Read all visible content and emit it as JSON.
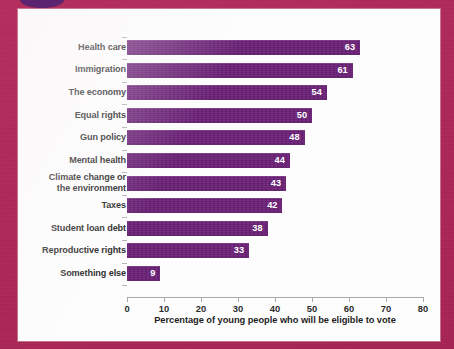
{
  "colors": {
    "background": "#b32a5c",
    "card": "#fdfdfd",
    "bar": "#6b2177",
    "value_text": "#ffffff",
    "axis": "#a9a9a9",
    "label_text": "#2c2c2c",
    "accent_ellipse": "#5c2470"
  },
  "decorations": {
    "top_ellipse_name": "purple-ellipse-decoration"
  },
  "chart_data": {
    "type": "bar",
    "orientation": "horizontal",
    "title": "",
    "xlabel": "Percentage of young people who will be eligible to vote",
    "ylabel": "",
    "xlim": [
      0,
      80
    ],
    "xticks": [
      0,
      10,
      20,
      30,
      40,
      50,
      60,
      70,
      80
    ],
    "xtick_labels": [
      "0",
      "10",
      "20",
      "30",
      "40",
      "50",
      "60",
      "70",
      "80"
    ],
    "grid": false,
    "legend": false,
    "categories": [
      "Health care",
      "Immigration",
      "The economy",
      "Equal rights",
      "Gun policy",
      "Mental health",
      "Climate change or the environment",
      "Taxes",
      "Student loan debt",
      "Reproductive rights",
      "Something else"
    ],
    "values": [
      63,
      61,
      54,
      50,
      48,
      44,
      43,
      42,
      38,
      33,
      9
    ],
    "data_labels": [
      "63",
      "61",
      "54",
      "50",
      "48",
      "44",
      "43",
      "42",
      "38",
      "33",
      "9"
    ],
    "bars": [
      {
        "category": "Health care",
        "label_lines": [
          "Health care"
        ],
        "value": 63,
        "data_label": "63"
      },
      {
        "category": "Immigration",
        "label_lines": [
          "Immigration"
        ],
        "value": 61,
        "data_label": "61"
      },
      {
        "category": "The economy",
        "label_lines": [
          "The economy"
        ],
        "value": 54,
        "data_label": "54"
      },
      {
        "category": "Equal rights",
        "label_lines": [
          "Equal rights"
        ],
        "value": 50,
        "data_label": "50"
      },
      {
        "category": "Gun policy",
        "label_lines": [
          "Gun policy"
        ],
        "value": 48,
        "data_label": "48"
      },
      {
        "category": "Mental health",
        "label_lines": [
          "Mental health"
        ],
        "value": 44,
        "data_label": "44"
      },
      {
        "category": "Climate change or the environment",
        "label_lines": [
          "Climate change or",
          "the environment"
        ],
        "value": 43,
        "data_label": "43"
      },
      {
        "category": "Taxes",
        "label_lines": [
          "Taxes"
        ],
        "value": 42,
        "data_label": "42"
      },
      {
        "category": "Student loan debt",
        "label_lines": [
          "Student loan debt"
        ],
        "value": 38,
        "data_label": "38"
      },
      {
        "category": "Reproductive rights",
        "label_lines": [
          "Reproductive rights"
        ],
        "value": 33,
        "data_label": "33"
      },
      {
        "category": "Something else",
        "label_lines": [
          "Something else"
        ],
        "value": 9,
        "data_label": "9"
      }
    ]
  }
}
